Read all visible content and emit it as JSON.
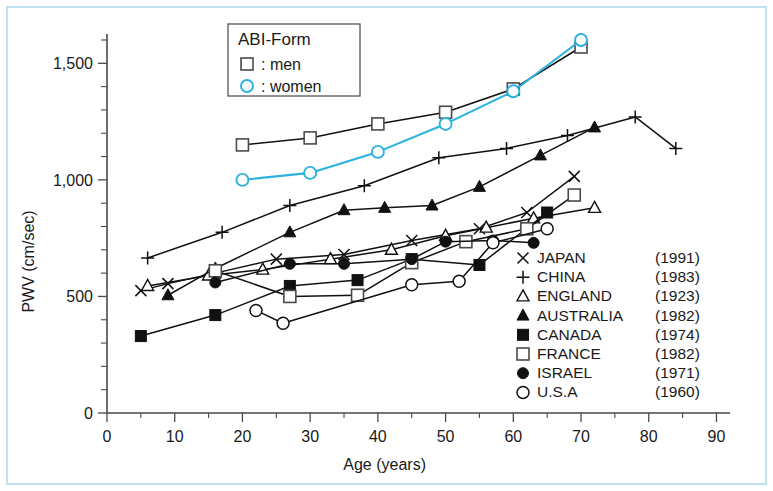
{
  "figure": {
    "frame_color": "#bfe2ef",
    "background": "#ffffff"
  },
  "axes": {
    "x_title": "Age (years)",
    "y_title": "PWV (cm/sec)",
    "x_ticks": [
      "0",
      "10",
      "20",
      "30",
      "40",
      "50",
      "60",
      "70",
      "80",
      "90"
    ],
    "y_ticks": [
      "0",
      "500",
      "1,000",
      "1,500"
    ]
  },
  "abi_box": {
    "title": "ABI-Form",
    "men_label": ": men",
    "women_label": ": women",
    "men_marker": "open-square-marker",
    "women_marker": "open-circle-cyan-marker",
    "men_color": "#111111",
    "women_color": "#2bb3e0"
  },
  "legend": {
    "entries": [
      {
        "marker": "cross-x-marker",
        "label": "JAPAN",
        "year": "(1991)"
      },
      {
        "marker": "plus-marker",
        "label": "CHINA",
        "year": "(1983)"
      },
      {
        "marker": "open-triangle-marker",
        "label": "ENGLAND",
        "year": "(1923)"
      },
      {
        "marker": "filled-triangle-marker",
        "label": "AUSTRALIA",
        "year": "(1982)"
      },
      {
        "marker": "filled-square-marker",
        "label": "CANADA",
        "year": "(1974)"
      },
      {
        "marker": "open-square-marker",
        "label": "FRANCE",
        "year": "(1982)"
      },
      {
        "marker": "filled-circle-marker",
        "label": "ISRAEL",
        "year": "(1971)"
      },
      {
        "marker": "open-circle-marker",
        "label": "U.S.A",
        "year": "(1960)"
      }
    ]
  },
  "chart_data": {
    "type": "line",
    "title": "",
    "xlabel": "Age (years)",
    "ylabel": "PWV (cm/sec)",
    "xlim": [
      0,
      92
    ],
    "ylim": [
      0,
      1600
    ],
    "xticks": [
      0,
      10,
      20,
      30,
      40,
      50,
      60,
      70,
      80,
      90
    ],
    "yticks": [
      0,
      500,
      1000,
      1500
    ],
    "y_minor_step": 100,
    "x_minor_step": 5,
    "grid": false,
    "legend_position": "lower-right",
    "series": [
      {
        "name": "ABI-Form men",
        "marker": "open-square",
        "color": "#111111",
        "x": [
          20,
          30,
          40,
          50,
          60,
          70
        ],
        "y": [
          1150,
          1180,
          1240,
          1290,
          1390,
          1570
        ]
      },
      {
        "name": "ABI-Form women",
        "marker": "open-circle",
        "color": "#2bb3e0",
        "x": [
          20,
          30,
          40,
          50,
          60,
          70
        ],
        "y": [
          1000,
          1030,
          1120,
          1240,
          1380,
          1600
        ]
      },
      {
        "name": "JAPAN",
        "year": "(1991)",
        "marker": "cross-x",
        "color": "#111111",
        "x": [
          5,
          9,
          16,
          25,
          35,
          45,
          55,
          62,
          69
        ],
        "y": [
          525,
          555,
          600,
          660,
          680,
          740,
          790,
          860,
          1015
        ]
      },
      {
        "name": "CHINA",
        "year": "(1983)",
        "marker": "plus",
        "color": "#111111",
        "x": [
          6,
          17,
          27,
          38,
          49,
          59,
          68,
          78,
          84
        ],
        "y": [
          665,
          775,
          890,
          975,
          1095,
          1135,
          1190,
          1270,
          1135
        ]
      },
      {
        "name": "ENGLAND",
        "year": "(1923)",
        "marker": "open-triangle",
        "color": "#111111",
        "x": [
          6,
          15,
          23,
          33,
          42,
          50,
          56,
          63,
          72
        ],
        "y": [
          545,
          590,
          615,
          660,
          700,
          760,
          795,
          835,
          880
        ]
      },
      {
        "name": "AUSTRALIA",
        "year": "(1982)",
        "marker": "filled-triangle",
        "color": "#111111",
        "x": [
          9,
          16,
          27,
          35,
          41,
          48,
          55,
          64,
          72
        ],
        "y": [
          505,
          620,
          775,
          870,
          880,
          890,
          970,
          1105,
          1225
        ]
      },
      {
        "name": "CANADA",
        "year": "(1974)",
        "marker": "filled-square",
        "color": "#111111",
        "x": [
          5,
          16,
          27,
          37,
          45,
          55,
          65
        ],
        "y": [
          330,
          420,
          545,
          570,
          660,
          635,
          860
        ]
      },
      {
        "name": "FRANCE",
        "year": "(1982)",
        "marker": "open-square",
        "color": "#111111",
        "x": [
          16,
          27,
          37,
          45,
          53,
          62,
          69
        ],
        "y": [
          610,
          500,
          505,
          645,
          735,
          790,
          935
        ]
      },
      {
        "name": "ISRAEL",
        "year": "(1971)",
        "marker": "filled-circle",
        "color": "#111111",
        "x": [
          16,
          27,
          35,
          45,
          50,
          57,
          63
        ],
        "y": [
          560,
          640,
          640,
          660,
          735,
          740,
          730
        ]
      },
      {
        "name": "U.S.A",
        "year": "(1960)",
        "marker": "open-circle",
        "color": "#111111",
        "x": [
          22,
          26,
          45,
          52,
          57,
          65
        ],
        "y": [
          440,
          385,
          550,
          565,
          730,
          790
        ]
      }
    ]
  }
}
